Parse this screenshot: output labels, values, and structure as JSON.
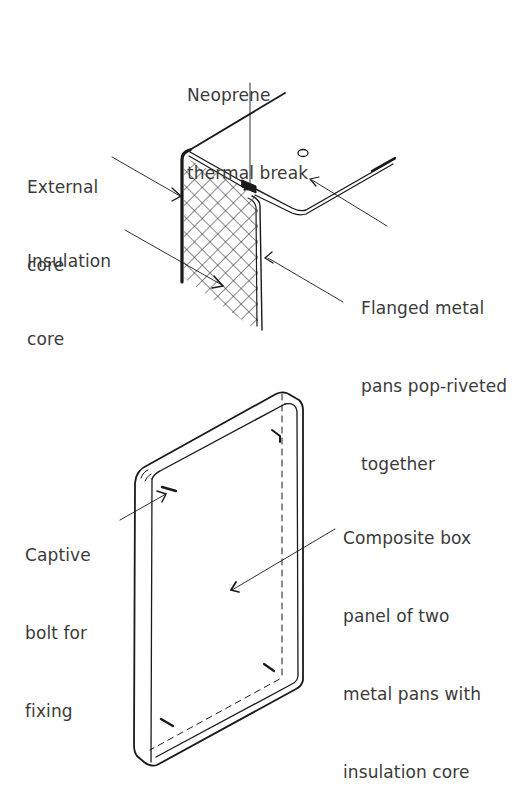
{
  "figure_top": {
    "title": "Flanged metal pan panel joint detail",
    "labels": {
      "neoprene": [
        "Neoprene",
        "thermal break"
      ],
      "external": [
        "External",
        "core"
      ],
      "insulation": [
        "Insulation",
        "core"
      ],
      "flanged": [
        "Flanged metal",
        "pans pop-riveted",
        "together"
      ]
    }
  },
  "figure_bottom": {
    "title": "Composite box panel",
    "labels": {
      "captive": [
        "Captive",
        "bolt for",
        "fixing"
      ],
      "composite": [
        "Composite box",
        "panel of two",
        "metal pans with",
        "insulation core"
      ]
    }
  },
  "colors": {
    "ink": "#1a1a1a",
    "text": "#3a3a3a",
    "background": "#ffffff"
  }
}
